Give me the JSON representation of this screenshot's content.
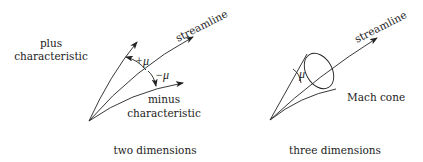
{
  "left_panel": {
    "caption": "two dimensions",
    "plus_label_line1": "plus",
    "plus_label_line2": "characteristic",
    "minus_label_line1": "minus",
    "minus_label_line2": "characteristic",
    "streamline_label": "streamline",
    "plus_angle_label": "+μ",
    "minus_angle_label": "−μ"
  },
  "right_panel": {
    "caption": "three dimensions",
    "streamline_label": "streamline",
    "angle_label": "μ",
    "cone_label": "Mach cone"
  },
  "colors": {
    "line": "#222222",
    "background": "#ffffff"
  }
}
